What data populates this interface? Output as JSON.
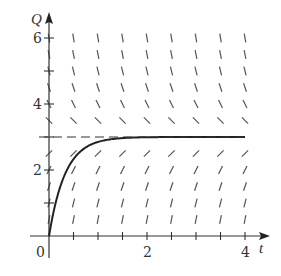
{
  "chart_data": {
    "type": "line",
    "title": "",
    "subtitle": "Slope field with solution curve",
    "xlabel": "t",
    "ylabel": "Q",
    "xlim": [
      0,
      4.4
    ],
    "ylim": [
      0,
      6.6
    ],
    "x_ticks": [
      0.5,
      1,
      1.5,
      2,
      2.5,
      3,
      3.5,
      4
    ],
    "x_tick_labels": [
      {
        "value": 0,
        "label": "0"
      },
      {
        "value": 2,
        "label": "2"
      },
      {
        "value": 4,
        "label": "4"
      }
    ],
    "y_ticks": [
      1,
      2,
      3,
      4,
      5,
      6
    ],
    "y_tick_labels": [
      {
        "value": 2,
        "label": "2"
      },
      {
        "value": 4,
        "label": "4"
      },
      {
        "value": 6,
        "label": "6"
      }
    ],
    "grid": false,
    "legend": null,
    "slope_field": {
      "equation": "dQ/dt = k(3 - Q)",
      "t_values": [
        0,
        0.5,
        1,
        1.5,
        2,
        2.5,
        3,
        3.5,
        4
      ],
      "q_values": [
        0.5,
        1,
        1.5,
        2,
        2.5,
        3.5,
        4,
        4.5,
        5,
        5.5,
        6
      ]
    },
    "series": [
      {
        "name": "solution curve Q(t) = 3(1 - e^{-3t})",
        "style": "solid",
        "x": [
          0,
          0.1,
          0.2,
          0.3,
          0.4,
          0.5,
          0.75,
          1,
          1.5,
          2,
          3,
          4
        ],
        "y": [
          0,
          0.78,
          1.35,
          1.78,
          2.09,
          2.33,
          2.68,
          2.85,
          2.97,
          2.99,
          3.0,
          3.0
        ]
      },
      {
        "name": "equilibrium Q = 3",
        "style": "dashed",
        "x": [
          0,
          4
        ],
        "y": [
          3,
          3
        ]
      }
    ],
    "annotations": []
  },
  "labels": {
    "origin": "0",
    "x_axis": "t",
    "y_axis": "Q"
  }
}
